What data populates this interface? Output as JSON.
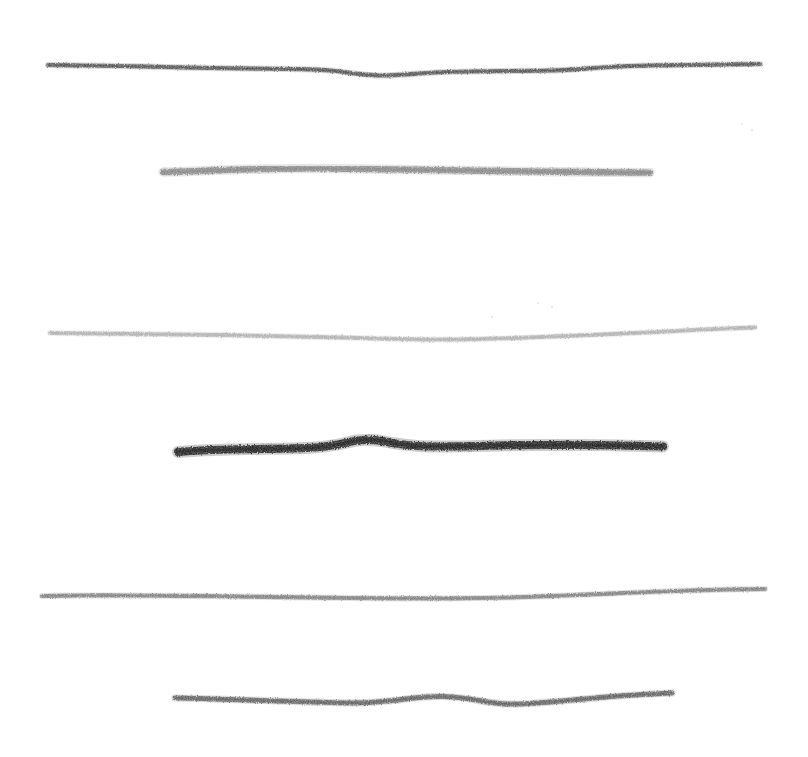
{
  "artwork": {
    "title": "Hand-drawn horizontal charcoal strokes",
    "medium": "pencil-charcoal-scan",
    "background_color": "#ffffff",
    "canvas": {
      "width": 808,
      "height": 757
    },
    "stroke_count": 6
  },
  "strokes": [
    {
      "index": 1,
      "name": "stroke-1-dark-gray-long",
      "color": "#4a4a4a",
      "thickness": 4.2,
      "opacity": 0.95,
      "x_start": 48,
      "x_end": 760,
      "y_center": 68,
      "description": "dark gray long line with shallow dip near middle",
      "points": [
        [
          48,
          65
        ],
        [
          80,
          65.5
        ],
        [
          120,
          66
        ],
        [
          165,
          67
        ],
        [
          210,
          68
        ],
        [
          255,
          68.6
        ],
        [
          300,
          69.2
        ],
        [
          330,
          70.5
        ],
        [
          355,
          73.5
        ],
        [
          380,
          75.5
        ],
        [
          405,
          74.5
        ],
        [
          435,
          72.5
        ],
        [
          470,
          71.5
        ],
        [
          510,
          71
        ],
        [
          550,
          70.5
        ],
        [
          580,
          69
        ],
        [
          610,
          67
        ],
        [
          650,
          65.5
        ],
        [
          690,
          65
        ],
        [
          725,
          64.5
        ],
        [
          760,
          64
        ]
      ]
    },
    {
      "index": 2,
      "name": "stroke-2-medium-gray-thick",
      "color": "#808080",
      "thickness": 6.4,
      "opacity": 0.93,
      "x_start": 163,
      "x_end": 650,
      "y_center": 170,
      "description": "medium gray thick line, broadest just right of its left end",
      "points": [
        [
          163,
          172
        ],
        [
          185,
          171.5
        ],
        [
          210,
          170.5
        ],
        [
          240,
          169.5
        ],
        [
          275,
          168.8
        ],
        [
          310,
          168.5
        ],
        [
          345,
          168.8
        ],
        [
          380,
          169.2
        ],
        [
          420,
          169.8
        ],
        [
          460,
          170.4
        ],
        [
          500,
          171
        ],
        [
          540,
          171.6
        ],
        [
          580,
          172
        ],
        [
          615,
          172.4
        ],
        [
          650,
          172.6
        ]
      ]
    },
    {
      "index": 3,
      "name": "stroke-3-light-gray-long",
      "color": "#a8a8a8",
      "thickness": 4.0,
      "opacity": 0.9,
      "x_start": 50,
      "x_end": 755,
      "y_center": 333,
      "description": "lightest gray long line with gentle sag through centre",
      "points": [
        [
          50,
          333
        ],
        [
          90,
          333.5
        ],
        [
          135,
          334
        ],
        [
          180,
          334.5
        ],
        [
          225,
          335
        ],
        [
          270,
          336
        ],
        [
          315,
          337
        ],
        [
          360,
          338
        ],
        [
          400,
          339
        ],
        [
          440,
          339.5
        ],
        [
          480,
          339
        ],
        [
          520,
          337.8
        ],
        [
          560,
          336.2
        ],
        [
          600,
          334.6
        ],
        [
          640,
          332.8
        ],
        [
          680,
          330.8
        ],
        [
          715,
          329
        ],
        [
          755,
          327.5
        ]
      ]
    },
    {
      "index": 4,
      "name": "stroke-4-black-thickest",
      "color": "#1a1a1a",
      "thickness": 8.2,
      "opacity": 1.0,
      "x_start": 178,
      "x_end": 663,
      "y_center": 445,
      "description": "near-black thickest line with a raised bump around x=355",
      "points": [
        [
          178,
          452
        ],
        [
          200,
          450.5
        ],
        [
          228,
          449.5
        ],
        [
          258,
          449
        ],
        [
          288,
          448.5
        ],
        [
          315,
          447.5
        ],
        [
          338,
          444.5
        ],
        [
          357,
          440.5
        ],
        [
          375,
          440.2
        ],
        [
          396,
          443.5
        ],
        [
          418,
          446
        ],
        [
          445,
          446.5
        ],
        [
          478,
          446
        ],
        [
          512,
          445.2
        ],
        [
          548,
          445
        ],
        [
          585,
          445
        ],
        [
          620,
          445.5
        ],
        [
          663,
          446.5
        ]
      ]
    },
    {
      "index": 5,
      "name": "stroke-5-medium-gray-long",
      "color": "#757575",
      "thickness": 4.2,
      "opacity": 0.92,
      "x_start": 42,
      "x_end": 765,
      "y_center": 594,
      "description": "medium gray long line drifting slightly upward to the right",
      "points": [
        [
          42,
          596
        ],
        [
          80,
          595.5
        ],
        [
          125,
          595.5
        ],
        [
          170,
          595.8
        ],
        [
          215,
          596.2
        ],
        [
          260,
          596.8
        ],
        [
          305,
          597.4
        ],
        [
          350,
          598
        ],
        [
          395,
          598.4
        ],
        [
          440,
          598.4
        ],
        [
          485,
          598
        ],
        [
          525,
          597
        ],
        [
          565,
          595.5
        ],
        [
          605,
          593.8
        ],
        [
          648,
          592
        ],
        [
          690,
          590.5
        ],
        [
          730,
          589.5
        ],
        [
          765,
          589
        ]
      ]
    },
    {
      "index": 6,
      "name": "stroke-6-dark-gray-wavy",
      "color": "#555555",
      "thickness": 5.0,
      "opacity": 0.94,
      "x_start": 175,
      "x_end": 672,
      "y_center": 697,
      "description": "dark gray wavy line rising near x=430 then dipping near x=505",
      "points": [
        [
          175,
          698
        ],
        [
          200,
          698.5
        ],
        [
          230,
          699.5
        ],
        [
          262,
          700.5
        ],
        [
          295,
          701.5
        ],
        [
          330,
          702.5
        ],
        [
          362,
          702.8
        ],
        [
          392,
          700.5
        ],
        [
          420,
          697.5
        ],
        [
          444,
          696.5
        ],
        [
          466,
          698.5
        ],
        [
          488,
          702
        ],
        [
          508,
          704
        ],
        [
          530,
          703.5
        ],
        [
          556,
          701.5
        ],
        [
          584,
          699
        ],
        [
          612,
          696.5
        ],
        [
          642,
          694.5
        ],
        [
          672,
          693
        ]
      ]
    }
  ],
  "specks": [
    {
      "name": "speck-upper-right-a",
      "x": 742,
      "y": 124,
      "size": 2.5
    },
    {
      "name": "speck-upper-right-b",
      "x": 752,
      "y": 130,
      "size": 2.0
    },
    {
      "name": "speck-mid-upper-a",
      "x": 538,
      "y": 303,
      "size": 2.0
    },
    {
      "name": "speck-mid-upper-b",
      "x": 552,
      "y": 307,
      "size": 1.8
    },
    {
      "name": "speck-mid-right",
      "x": 492,
      "y": 317,
      "size": 1.6
    }
  ]
}
